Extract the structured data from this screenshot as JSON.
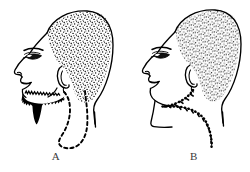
{
  "plate": {
    "title": "Two lateral head profile illustrations labelled A and B",
    "background_color": "#ffffff",
    "ink_color": "#000000",
    "label_color": "#3a3a3a",
    "width": 250,
    "height": 172
  },
  "figures": [
    {
      "id": "A",
      "label": "A",
      "description": "Left-facing head in lateral profile with stippled cropped hair, visible ear, solid black full beard along the jaw and chin, and a dashed closed loop outlining a region hanging below the jaw and neck",
      "features": {
        "hair": "stippled-hair-region",
        "ear": "ear",
        "eye": "eye",
        "brow": "eyebrow",
        "nose": "nose",
        "lips": "lips",
        "beard": "solid-black-beard",
        "marking": "dashed-loop-outline",
        "marking_style": "dashed"
      }
    },
    {
      "id": "B",
      "label": "B",
      "description": "Left-facing head in lateral profile with stippled cropped hair, visible ear, clean-shaven smooth jaw, and a beaded dotted line running from below the ear along the jaw and down the neck",
      "features": {
        "hair": "stippled-hair-region",
        "ear": "ear",
        "eye": "eye",
        "brow": "eyebrow",
        "nose": "nose",
        "lips": "lips",
        "beard": "none",
        "marking": "beaded-dotted-path",
        "marking_style": "beaded"
      }
    }
  ]
}
